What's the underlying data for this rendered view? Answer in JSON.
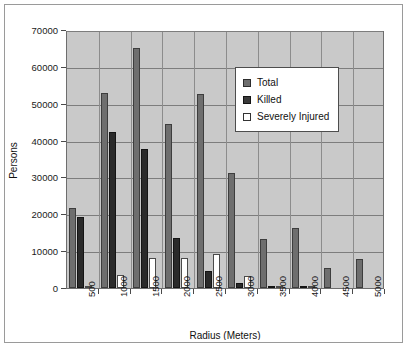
{
  "chart_data": {
    "type": "bar",
    "title": "",
    "xlabel": "Radius (Meters)",
    "ylabel": "Persons",
    "categories": [
      "500",
      "1000",
      "1500",
      "2000",
      "2500",
      "3000",
      "3500",
      "4000",
      "4500",
      "5000"
    ],
    "series": [
      {
        "name": "Total",
        "color": "#6e6e6e",
        "values": [
          21800,
          53000,
          65000,
          44500,
          52700,
          31300,
          13300,
          16200,
          5500,
          7800
        ]
      },
      {
        "name": "Killed",
        "color": "#2a2a2a",
        "values": [
          19300,
          42400,
          37700,
          13700,
          4600,
          1300,
          150,
          100,
          0,
          0
        ]
      },
      {
        "name": "Severely Injured",
        "color": "#ffffff",
        "values": [
          600,
          3400,
          8100,
          8100,
          9300,
          3200,
          150,
          100,
          0,
          0
        ]
      }
    ],
    "ylim": [
      0,
      70000
    ],
    "yticks": [
      0,
      10000,
      20000,
      30000,
      40000,
      50000,
      60000,
      70000
    ],
    "ytick_labels": [
      "0",
      "10000",
      "20000",
      "30000",
      "40000",
      "50000",
      "60000",
      "70000"
    ],
    "grid": true,
    "legend_position": "upper right",
    "plot_background": "#c9c9c9",
    "page_background": "#ffffff"
  },
  "legend": {
    "items": [
      {
        "label": "Total"
      },
      {
        "label": "Killed"
      },
      {
        "label": "Severely Injured"
      }
    ]
  }
}
